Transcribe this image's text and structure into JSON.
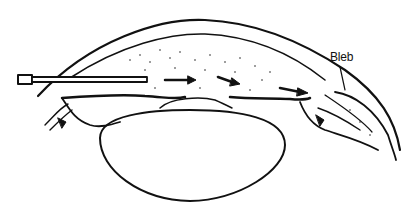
{
  "diagram": {
    "labels": [
      {
        "id": "bleb",
        "text": "Bleb"
      }
    ],
    "elements": [
      "cornea",
      "anterior-chamber",
      "cannula",
      "iris",
      "lens",
      "ciliary-body",
      "sclera",
      "bleb",
      "flow-arrows"
    ],
    "colors": {
      "line": "#111111",
      "background": "#ffffff"
    }
  }
}
